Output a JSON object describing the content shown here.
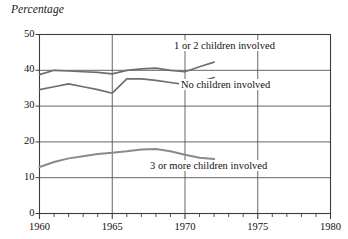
{
  "chart_data": {
    "type": "line",
    "title": "",
    "ylabel": "Percentage",
    "xlabel": "",
    "xlim": [
      1960,
      1980
    ],
    "ylim": [
      0,
      50
    ],
    "grid": true,
    "legend_position": "inline-annotations",
    "y_ticks": [
      0,
      10,
      20,
      30,
      40,
      50
    ],
    "x_ticks": [
      1960,
      1965,
      1970,
      1975,
      1980
    ],
    "x_minor_tick_step": 1,
    "gridlines_y": [
      10,
      20,
      30,
      40
    ],
    "gridlines_x": [
      1965,
      1970,
      1975
    ],
    "series": [
      {
        "name": "1 or 2 children involved",
        "color": "#6e6e6e",
        "x": [
          1960,
          1961,
          1962,
          1963,
          1964,
          1965,
          1966,
          1967,
          1968,
          1969,
          1970,
          1971,
          1972
        ],
        "values": [
          38.8,
          40.0,
          39.8,
          39.6,
          39.4,
          39.0,
          40.0,
          40.4,
          40.6,
          40.0,
          39.6,
          41.0,
          42.3
        ]
      },
      {
        "name": "No children involved",
        "color": "#6e6e6e",
        "x": [
          1960,
          1961,
          1962,
          1963,
          1964,
          1965,
          1966,
          1967,
          1968,
          1969,
          1970,
          1971,
          1972
        ],
        "values": [
          34.6,
          35.4,
          36.2,
          35.4,
          34.6,
          33.6,
          37.6,
          37.6,
          37.2,
          36.6,
          36.0,
          36.8,
          38.0
        ]
      },
      {
        "name": "3 or more children involved",
        "color": "#8a8a8a",
        "x": [
          1960,
          1961,
          1962,
          1963,
          1964,
          1965,
          1966,
          1967,
          1968,
          1969,
          1970,
          1971,
          1972
        ],
        "values": [
          13.0,
          14.4,
          15.4,
          16.0,
          16.6,
          17.0,
          17.4,
          17.9,
          18.0,
          17.4,
          16.4,
          15.6,
          15.2
        ]
      }
    ],
    "annotations": [
      {
        "text": "1 or 2 children involved",
        "series": "1 or 2 children involved"
      },
      {
        "text": "No children involved",
        "series": "No children involved"
      },
      {
        "text": "3 or more children involved",
        "series": "3 or more children involved"
      }
    ]
  },
  "colors": {
    "frame": "#3c3c3c",
    "grid": "#555555",
    "text": "#111111",
    "background": "#ffffff"
  }
}
